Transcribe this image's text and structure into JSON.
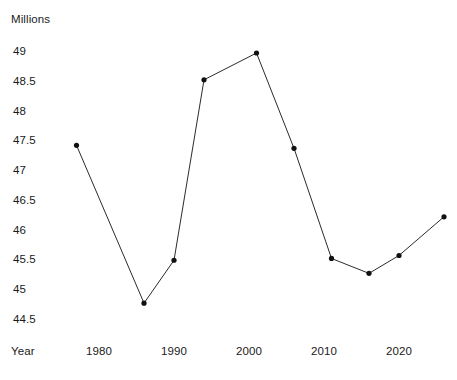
{
  "chart_data": {
    "type": "line",
    "title": "",
    "subtitle": "",
    "xlabel": "Year",
    "ylabel": "Millions",
    "grid": false,
    "legend": false,
    "legend_position": "none",
    "xlim": [
      1974,
      2029
    ],
    "ylim": [
      44.25,
      49.25
    ],
    "x_tick_labels": [
      "1980",
      "1990",
      "2000",
      "2010",
      "2020"
    ],
    "x_ticks": [
      1980,
      1990,
      2000,
      2010,
      2020
    ],
    "y_tick_labels": [
      "49",
      "48.5",
      "48",
      "47.5",
      "47",
      "46.5",
      "46",
      "45.5",
      "45",
      "44.5"
    ],
    "y_ticks": [
      49,
      48.5,
      48,
      47.5,
      47,
      46.5,
      46,
      45.5,
      45,
      44.5
    ],
    "x": [
      1977,
      1986,
      1990,
      1994,
      2001,
      2006,
      2011,
      2016,
      2020,
      2026
    ],
    "values": [
      47.45,
      44.8,
      45.52,
      48.55,
      49.0,
      47.4,
      45.55,
      45.3,
      45.6,
      46.25
    ],
    "series": [
      {
        "name": "Millions",
        "color": "#2b2b2b",
        "marker": "circle",
        "points": [
          {
            "x": 1977,
            "y": 47.45
          },
          {
            "x": 1986,
            "y": 44.8
          },
          {
            "x": 1990,
            "y": 45.52
          },
          {
            "x": 1994,
            "y": 48.55
          },
          {
            "x": 2001,
            "y": 49.0
          },
          {
            "x": 2006,
            "y": 47.4
          },
          {
            "x": 2011,
            "y": 45.55
          },
          {
            "x": 2016,
            "y": 45.3
          },
          {
            "x": 2020,
            "y": 45.6
          },
          {
            "x": 2026,
            "y": 46.25
          }
        ]
      }
    ],
    "colors": {
      "line": "#2b2b2b",
      "marker": "#111111",
      "text": "#1a1a1a",
      "background": "#ffffff"
    }
  },
  "axes": {
    "y_title": "Millions",
    "x_title": "Year"
  }
}
